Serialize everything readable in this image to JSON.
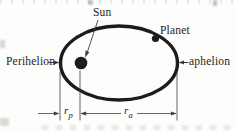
{
  "figure": {
    "labels": {
      "sun": "Sun",
      "planet": "Planet",
      "perihelion": "Perihelion",
      "aphelion": "aphelion",
      "rp_base": "r",
      "rp_sub": "p",
      "ra_base": "r",
      "ra_sub": "a"
    },
    "colors": {
      "ink": "#1c1c1c",
      "thin_line": "#3d3d3d",
      "background": "#fdfdfb"
    }
  }
}
